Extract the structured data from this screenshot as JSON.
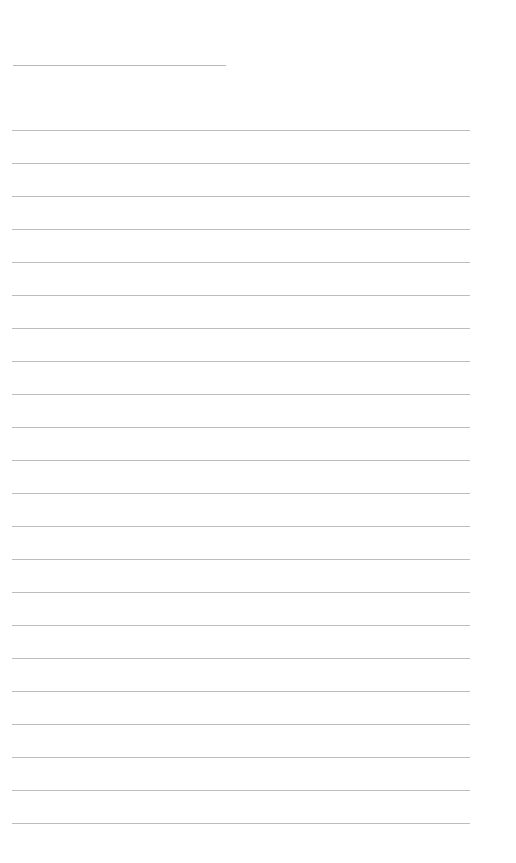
{
  "page": {
    "type": "lined-paper",
    "background": "#ffffff",
    "line_color": "#bdbdbd",
    "title_line": {
      "present": true
    },
    "ruled_lines": {
      "count": 22,
      "first_y": 130,
      "spacing": 33
    }
  }
}
